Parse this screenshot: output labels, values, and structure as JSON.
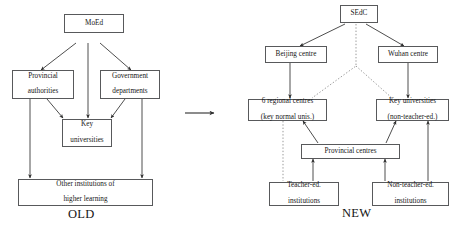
{
  "diagram": {
    "title_old": "OLD",
    "title_new": "NEW",
    "transition_arrow": "rightwards-arrow",
    "old_system": {
      "caption": "OLD",
      "nodes": [
        {
          "id": "moed",
          "label": "MoEd"
        },
        {
          "id": "provincial-authorities",
          "label": "Provincial\nauthorities",
          "line1": "Provincial",
          "line2": "authorities"
        },
        {
          "id": "government-departments",
          "label": "Government\ndepartments",
          "line1": "Government",
          "line2": "departments"
        },
        {
          "id": "key-universities",
          "label": "Key\nuniversities",
          "line1": "Key",
          "line2": "universities"
        },
        {
          "id": "other-institutions",
          "label": "Other institutions of\nhigher learning",
          "line1": "Other institutions of",
          "line2": "higher learning"
        }
      ],
      "edges": [
        {
          "from": "moed",
          "to": "provincial-authorities",
          "style": "solid",
          "arrow": true
        },
        {
          "from": "moed",
          "to": "key-universities",
          "style": "solid",
          "arrow": true
        },
        {
          "from": "moed",
          "to": "government-departments",
          "style": "solid",
          "arrow": true
        },
        {
          "from": "provincial-authorities",
          "to": "key-universities",
          "style": "solid",
          "arrow": true
        },
        {
          "from": "government-departments",
          "to": "key-universities",
          "style": "solid",
          "arrow": true
        },
        {
          "from": "provincial-authorities",
          "to": "other-institutions",
          "style": "solid",
          "arrow": true
        },
        {
          "from": "government-departments",
          "to": "other-institutions",
          "style": "solid",
          "arrow": true
        }
      ]
    },
    "new_system": {
      "caption": "NEW",
      "nodes": [
        {
          "id": "sedc",
          "label": "SEdC"
        },
        {
          "id": "beijing-centre",
          "label": "Beijing centre"
        },
        {
          "id": "wuhan-centre",
          "label": "Wuhan centre"
        },
        {
          "id": "regional-centres",
          "label": "6 regional centres\n(key normal unis.)",
          "line1": "6 regional centres",
          "line2": "(key normal unis.)"
        },
        {
          "id": "key-universities-new",
          "label": "Key universities\n(non-teacher-ed.)",
          "line1": "Key universities",
          "line2": "(non-teacher-ed.)"
        },
        {
          "id": "provincial-centres",
          "label": "Provincial centres"
        },
        {
          "id": "teacher-ed-institutions",
          "label": "Teacher-ed.\ninstitutions",
          "line1": "Teacher-ed.",
          "line2": "institutions"
        },
        {
          "id": "non-teacher-ed-institutions",
          "label": "Non-teacher-ed.\ninstitutions",
          "line1": "Non-teacher-ed.",
          "line2": "institutions"
        }
      ],
      "edges": [
        {
          "from": "sedc",
          "to": "beijing-centre",
          "style": "solid",
          "arrow": true
        },
        {
          "from": "sedc",
          "to": "wuhan-centre",
          "style": "solid",
          "arrow": true
        },
        {
          "from": "sedc",
          "to": "regional-centres",
          "style": "dotted",
          "arrow": false
        },
        {
          "from": "sedc",
          "to": "key-universities-new",
          "style": "dotted",
          "arrow": false
        },
        {
          "from": "beijing-centre",
          "to": "regional-centres",
          "style": "solid",
          "arrow": true
        },
        {
          "from": "wuhan-centre",
          "to": "key-universities-new",
          "style": "solid",
          "arrow": true
        },
        {
          "from": "regional-centres",
          "to": "teacher-ed-institutions",
          "style": "dotted",
          "arrow": false
        },
        {
          "from": "provincial-centres",
          "to": "regional-centres",
          "style": "solid",
          "arrow": true
        },
        {
          "from": "provincial-centres",
          "to": "key-universities-new",
          "style": "solid",
          "arrow": true
        },
        {
          "from": "teacher-ed-institutions",
          "to": "provincial-centres",
          "style": "solid",
          "arrow": true
        },
        {
          "from": "non-teacher-ed-institutions",
          "to": "provincial-centres",
          "style": "solid",
          "arrow": true
        },
        {
          "from": "non-teacher-ed-institutions",
          "to": "key-universities-new",
          "style": "solid",
          "arrow": true
        }
      ]
    },
    "colors": {
      "box_border": "#58595b",
      "line": "#3a3a3a",
      "text": "#151515",
      "background": "#ffffff"
    }
  }
}
